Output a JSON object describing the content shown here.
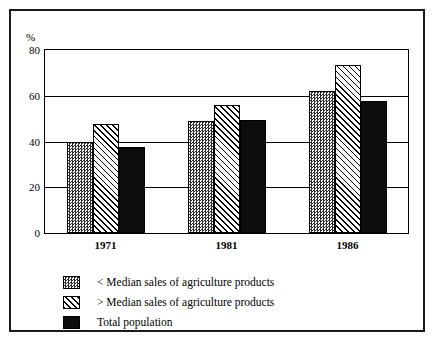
{
  "chart_data": {
    "type": "bar",
    "title": "",
    "subtitle": "",
    "xlabel": "",
    "ylabel": "%",
    "categories": [
      "1971",
      "1981",
      "1986"
    ],
    "series": [
      {
        "name": "< Median sales of agriculture products",
        "pattern": "dotted-gray",
        "values": [
          40,
          49,
          62
        ]
      },
      {
        "name": "> Median sales of agriculture products",
        "pattern": "diagonal-hatch",
        "values": [
          47.5,
          56,
          73.5
        ]
      },
      {
        "name": "Total population",
        "pattern": "solid-black",
        "values": [
          37.5,
          49.5,
          57.5
        ]
      }
    ],
    "ylim": [
      0,
      80
    ],
    "yticks": [
      0,
      20,
      40,
      60,
      80
    ],
    "ytick_labels": [
      "0",
      "20",
      "40",
      "60",
      "80"
    ],
    "grid": true,
    "grid_axis": "y",
    "legend_position": "below-plot",
    "colors": {
      "axis": "#000000",
      "series_1": "#2e2e2e",
      "series_2": "#000000",
      "series_3": "#0d0d0d",
      "background": "#ffffff",
      "frame": "#1a1a1a"
    }
  },
  "legend": {
    "entries": [
      {
        "label": "< Median sales of agriculture products"
      },
      {
        "label": "> Median sales of agriculture products"
      },
      {
        "label": "Total population"
      }
    ]
  }
}
